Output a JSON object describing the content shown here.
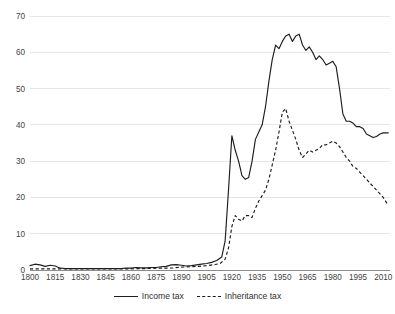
{
  "chart_data": {
    "type": "line",
    "title": "",
    "xlabel": "",
    "ylabel": "",
    "xlim": [
      1800,
      2014
    ],
    "ylim": [
      0,
      70
    ],
    "grid": true,
    "legend_position": "bottom-center",
    "y_ticks": [
      0,
      10,
      20,
      30,
      40,
      50,
      60,
      70
    ],
    "x_ticks": [
      1800,
      1815,
      1830,
      1845,
      1860,
      1875,
      1890,
      1905,
      1920,
      1935,
      1950,
      1965,
      1980,
      1995,
      2010
    ],
    "series": [
      {
        "name": "Income tax",
        "style": "solid",
        "color": "#1d1d1d",
        "x": [
          1800,
          1803,
          1806,
          1809,
          1812,
          1815,
          1818,
          1821,
          1824,
          1827,
          1830,
          1833,
          1836,
          1839,
          1842,
          1845,
          1848,
          1851,
          1854,
          1857,
          1860,
          1863,
          1866,
          1869,
          1872,
          1875,
          1878,
          1881,
          1884,
          1887,
          1890,
          1893,
          1896,
          1899,
          1902,
          1905,
          1908,
          1911,
          1914,
          1916,
          1918,
          1920,
          1922,
          1924,
          1926,
          1928,
          1930,
          1932,
          1934,
          1936,
          1938,
          1940,
          1942,
          1944,
          1946,
          1948,
          1950,
          1952,
          1954,
          1956,
          1958,
          1960,
          1962,
          1964,
          1966,
          1968,
          1970,
          1972,
          1974,
          1976,
          1978,
          1980,
          1982,
          1984,
          1986,
          1988,
          1990,
          1992,
          1994,
          1996,
          1998,
          2000,
          2002,
          2004,
          2006,
          2008,
          2010,
          2012,
          2013
        ],
        "y": [
          1.2,
          1.6,
          1.4,
          1.0,
          1.3,
          1.1,
          0.5,
          0.4,
          0.4,
          0.4,
          0.4,
          0.4,
          0.4,
          0.4,
          0.4,
          0.4,
          0.4,
          0.4,
          0.4,
          0.5,
          0.5,
          0.7,
          0.6,
          0.6,
          0.7,
          0.7,
          0.9,
          1.0,
          1.4,
          1.5,
          1.3,
          1.1,
          1.2,
          1.4,
          1.6,
          1.8,
          2.1,
          2.6,
          3.6,
          8.0,
          22.0,
          37.0,
          33.0,
          30.0,
          26.0,
          25.0,
          25.5,
          30.0,
          36.0,
          38.0,
          40.0,
          45.0,
          52.0,
          58.0,
          62.0,
          61.0,
          63.0,
          64.5,
          65.0,
          63.0,
          64.5,
          65.0,
          62.0,
          60.5,
          61.5,
          60.0,
          58.0,
          59.0,
          58.0,
          56.5,
          57.0,
          57.5,
          56.0,
          50.0,
          43.0,
          41.0,
          41.0,
          40.5,
          39.5,
          39.5,
          39.0,
          37.5,
          37.0,
          36.5,
          36.8,
          37.5,
          37.8,
          37.8,
          37.8
        ]
      },
      {
        "name": "Inheritance tax",
        "style": "dashed",
        "color": "#1d1d1d",
        "x": [
          1800,
          1805,
          1810,
          1815,
          1820,
          1825,
          1830,
          1835,
          1840,
          1845,
          1850,
          1855,
          1860,
          1865,
          1870,
          1875,
          1880,
          1885,
          1890,
          1895,
          1900,
          1905,
          1910,
          1913,
          1916,
          1918,
          1920,
          1922,
          1924,
          1926,
          1928,
          1930,
          1932,
          1934,
          1936,
          1938,
          1940,
          1942,
          1944,
          1946,
          1948,
          1950,
          1952,
          1954,
          1956,
          1958,
          1960,
          1962,
          1964,
          1966,
          1968,
          1970,
          1972,
          1974,
          1976,
          1978,
          1980,
          1982,
          1984,
          1986,
          1988,
          1990,
          1992,
          1994,
          1996,
          1998,
          2000,
          2002,
          2004,
          2006,
          2008,
          2010,
          2012,
          2013
        ],
        "y": [
          0.3,
          0.3,
          0.3,
          0.3,
          0.3,
          0.3,
          0.3,
          0.3,
          0.3,
          0.3,
          0.3,
          0.3,
          0.3,
          0.4,
          0.4,
          0.5,
          0.5,
          0.6,
          0.8,
          0.9,
          1.0,
          1.2,
          1.5,
          1.8,
          3.0,
          6.0,
          12.0,
          15.0,
          14.0,
          13.5,
          15.0,
          15.0,
          14.5,
          17.0,
          19.0,
          20.5,
          22.0,
          25.0,
          29.0,
          33.0,
          38.0,
          43.5,
          44.5,
          41.0,
          38.5,
          36.0,
          33.0,
          31.0,
          32.0,
          33.0,
          32.5,
          33.0,
          33.5,
          34.5,
          34.5,
          35.0,
          35.5,
          35.0,
          34.0,
          32.5,
          31.0,
          30.0,
          28.5,
          28.0,
          27.0,
          26.0,
          25.0,
          24.0,
          23.0,
          22.0,
          21.0,
          20.0,
          18.5,
          18.0
        ]
      }
    ]
  },
  "legend": {
    "income_label": "Income tax",
    "inheritance_label": "Inheritance tax"
  }
}
